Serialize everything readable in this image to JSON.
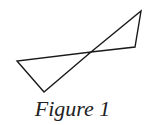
{
  "figure": {
    "caption": "Figure 1",
    "stroke_color": "#1a1a1a",
    "stroke_width": 1.4,
    "shapes": [
      {
        "name": "left-triangle",
        "points": [
          [
            17,
            61
          ],
          [
            44,
            92
          ],
          [
            91,
            52
          ]
        ]
      },
      {
        "name": "right-triangle",
        "points": [
          [
            91,
            52
          ],
          [
            141,
            11
          ],
          [
            135,
            47
          ]
        ]
      }
    ],
    "intersection_point": [
      91,
      52
    ]
  }
}
